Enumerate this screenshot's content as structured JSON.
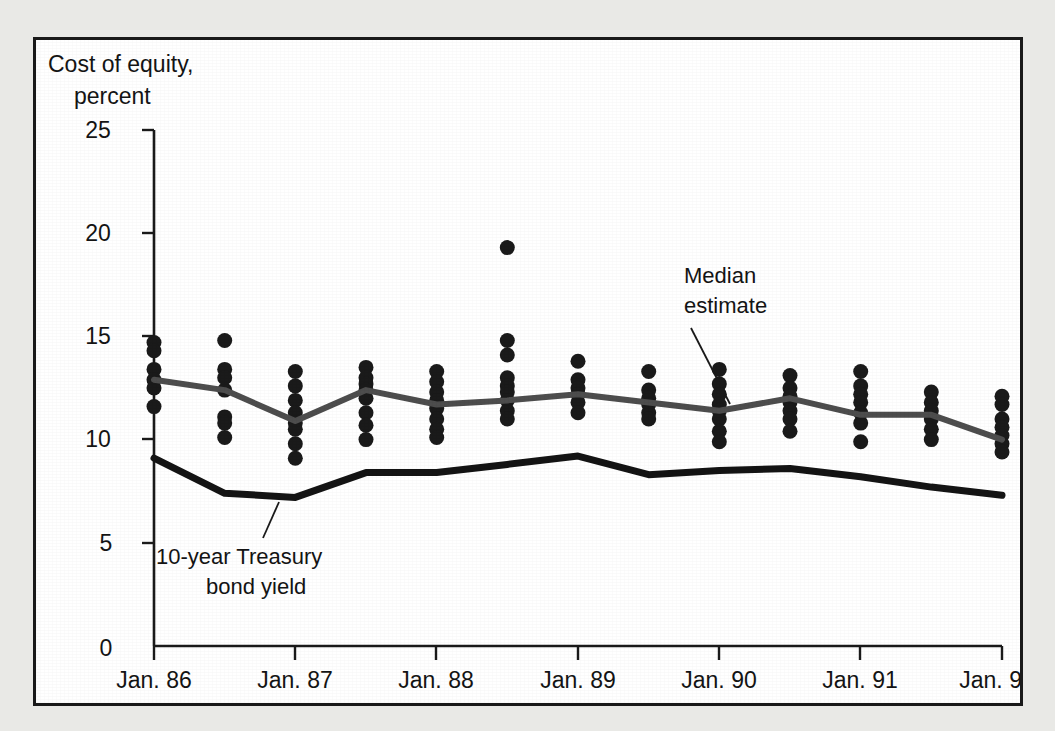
{
  "figure": {
    "background_color": "#e9e9e6",
    "panel_color": "#ffffff",
    "border_color": "#1a1a1a"
  },
  "chart_data": {
    "type": "scatter",
    "title": "",
    "subtitle": "",
    "ylabel_line1": "Cost of equity,",
    "ylabel_line2": "percent",
    "xlabel": "",
    "ylim": [
      0,
      25
    ],
    "yticks": [
      0,
      5,
      10,
      15,
      20,
      25
    ],
    "ytick_labels": [
      "0",
      "5",
      "10",
      "15",
      "20",
      "25"
    ],
    "xticks": [
      "Jan. 86",
      "Jan. 87",
      "Jan. 88",
      "Jan. 89",
      "Jan. 90",
      "Jan. 91",
      "Jan. 92"
    ],
    "xtick_labels": [
      "Jan. 86",
      "Jan. 87",
      "Jan. 88",
      "Jan. 89",
      "Jan. 90",
      "Jan. 91",
      "Jan. 92"
    ],
    "xlim_years": [
      1986.0,
      1992.0
    ],
    "grid": false,
    "legend_position": "inline-annotation",
    "colors": {
      "median_line": "#4d4d4d",
      "treasury_line": "#141414",
      "dots": "#1a1a1a"
    },
    "series": [
      {
        "name": "Median estimate",
        "type": "line",
        "color": "#4d4d4d",
        "x": [
          1986.0,
          1986.5,
          1987.0,
          1987.5,
          1988.0,
          1988.5,
          1989.0,
          1989.5,
          1990.0,
          1990.5,
          1991.0,
          1991.5,
          1992.0
        ],
        "values": [
          12.9,
          12.4,
          10.9,
          12.4,
          11.7,
          11.9,
          12.2,
          11.8,
          11.4,
          12.0,
          11.2,
          11.2,
          10.0
        ]
      },
      {
        "name": "10-year Treasury bond yield",
        "type": "line",
        "color": "#141414",
        "x": [
          1986.0,
          1986.5,
          1987.0,
          1987.5,
          1988.0,
          1988.5,
          1989.0,
          1989.5,
          1990.0,
          1990.5,
          1991.0,
          1991.5,
          1992.0
        ],
        "values": [
          9.1,
          7.4,
          7.2,
          8.4,
          8.4,
          8.8,
          9.2,
          8.3,
          8.5,
          8.6,
          8.2,
          7.7,
          7.3
        ]
      },
      {
        "name": "Individual estimates",
        "type": "scatter",
        "color": "#1a1a1a",
        "points": [
          {
            "x": 1986.0,
            "values": [
              14.7,
              14.3,
              13.4,
              12.9,
              12.5,
              11.6
            ]
          },
          {
            "x": 1986.5,
            "values": [
              14.8,
              13.4,
              13.0,
              12.4,
              11.1,
              10.8,
              10.1
            ]
          },
          {
            "x": 1987.0,
            "values": [
              13.3,
              12.6,
              11.9,
              11.3,
              10.8,
              10.5,
              9.8,
              9.1
            ]
          },
          {
            "x": 1987.5,
            "values": [
              13.5,
              13.0,
              12.7,
              12.4,
              12.0,
              11.3,
              10.7,
              10.0
            ]
          },
          {
            "x": 1988.0,
            "values": [
              13.3,
              12.8,
              12.3,
              11.9,
              11.5,
              11.0,
              10.5,
              10.1
            ]
          },
          {
            "x": 1988.5,
            "values": [
              19.3,
              14.8,
              14.1,
              13.0,
              12.6,
              12.3,
              11.9,
              11.4,
              11.0
            ]
          },
          {
            "x": 1989.0,
            "values": [
              13.8,
              12.9,
              12.5,
              12.2,
              11.8,
              11.3
            ]
          },
          {
            "x": 1989.5,
            "values": [
              13.3,
              12.4,
              12.0,
              11.7,
              11.3,
              11.0
            ]
          },
          {
            "x": 1990.0,
            "values": [
              13.4,
              12.7,
              12.2,
              11.7,
              11.4,
              11.0,
              10.4,
              9.9
            ]
          },
          {
            "x": 1990.5,
            "values": [
              13.1,
              12.5,
              12.1,
              11.8,
              11.4,
              11.0,
              10.4
            ]
          },
          {
            "x": 1991.0,
            "values": [
              13.3,
              12.6,
              12.2,
              11.8,
              11.3,
              10.8,
              9.9
            ]
          },
          {
            "x": 1991.5,
            "values": [
              12.3,
              11.8,
              11.4,
              11.0,
              10.5,
              10.0
            ]
          },
          {
            "x": 1992.0,
            "values": [
              12.1,
              11.7,
              11.0,
              10.6,
              10.2,
              9.8,
              9.4
            ]
          }
        ]
      }
    ],
    "annotations": [
      {
        "id": "median-estimate",
        "text_line1": "Median",
        "text_line2": "estimate",
        "text": "Median estimate"
      },
      {
        "id": "treasury-yield",
        "text_line1": "10-year Treasury",
        "text_line2": "bond yield",
        "text": "10-year Treasury bond yield"
      }
    ]
  }
}
